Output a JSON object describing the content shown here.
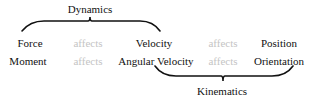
{
  "diagram": {
    "top_group": {
      "label": "Dynamics",
      "spans": [
        "Force",
        "Velocity"
      ]
    },
    "bottom_group": {
      "label": "Kinematics",
      "spans": [
        "Angular Velocity",
        "Orientation"
      ]
    },
    "rows": [
      {
        "cells": [
          "Force",
          "affects",
          "Velocity",
          "affects",
          "Position"
        ]
      },
      {
        "cells": [
          "Moment",
          "affects",
          "Angular Velocity",
          "affects",
          "Orientation"
        ]
      }
    ],
    "colors": {
      "text": "#111111",
      "relation_text": "#c4c4c4",
      "brace": "#111111",
      "background": "#ffffff"
    }
  }
}
